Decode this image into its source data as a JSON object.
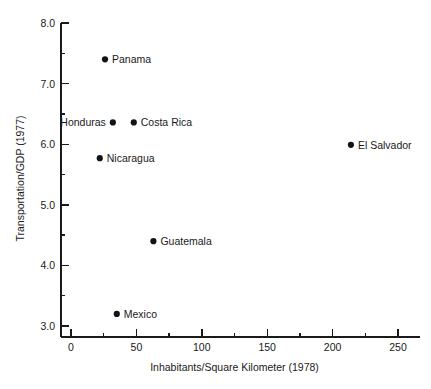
{
  "chart_data": {
    "type": "scatter",
    "title": "",
    "xlabel": "Inhabitants/Square Kilometer (1978)",
    "ylabel": "Transportation/GDP (1977)",
    "xlim": [
      -8,
      258
    ],
    "ylim": [
      2.82,
      8.0
    ],
    "grid": false,
    "legend": "none",
    "x_ticks": [
      0,
      50,
      100,
      150,
      200,
      250
    ],
    "x_tick_labels": [
      "0",
      "50",
      "100",
      "150",
      "200",
      "250"
    ],
    "x_minor_ticks": [
      25,
      75,
      125,
      175,
      225
    ],
    "y_ticks": [
      3.0,
      4.0,
      5.0,
      6.0,
      7.0,
      8.0
    ],
    "y_tick_labels": [
      "3.0",
      "4.0",
      "5.0",
      "6.0",
      "7.0",
      "8.0"
    ],
    "y_minor_ticks": [
      3.5,
      4.5,
      5.5,
      6.5,
      7.5
    ],
    "marker_color": "#141414",
    "axis_color": "#1a1a1a",
    "points": [
      {
        "label": "Panama",
        "x": 26,
        "y": 7.4,
        "label_side": "right"
      },
      {
        "label": "Honduras",
        "x": 32,
        "y": 6.36,
        "label_side": "left"
      },
      {
        "label": "Costa Rica",
        "x": 48,
        "y": 6.36,
        "label_side": "right"
      },
      {
        "label": "Nicaragua",
        "x": 22,
        "y": 5.77,
        "label_side": "right"
      },
      {
        "label": "El Salvador",
        "x": 214,
        "y": 5.99,
        "label_side": "right"
      },
      {
        "label": "Guatemala",
        "x": 63,
        "y": 4.4,
        "label_side": "right"
      },
      {
        "label": "Mexico",
        "x": 35,
        "y": 3.2,
        "label_side": "right"
      }
    ]
  }
}
